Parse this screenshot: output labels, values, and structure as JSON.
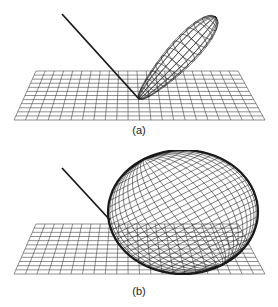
{
  "figure": {
    "panels": [
      {
        "id": "a",
        "label": "(a)",
        "description": "Narrow elongated wireframe lobe rising from incidence point on a gridded plane; incident ray line from upper-left",
        "lobe": {
          "shape": "narrow-ellipsoid",
          "direction": "specular"
        }
      },
      {
        "id": "b",
        "label": "(b)",
        "description": "Broad, nearly spherical wireframe lobe resting on a gridded plane; incident ray line from upper-left",
        "lobe": {
          "shape": "broad-ellipsoid",
          "direction": "diffuse"
        }
      }
    ],
    "colors": {
      "line": "#1a1a1a",
      "grid": "#333333",
      "background": "#ffffff"
    }
  }
}
